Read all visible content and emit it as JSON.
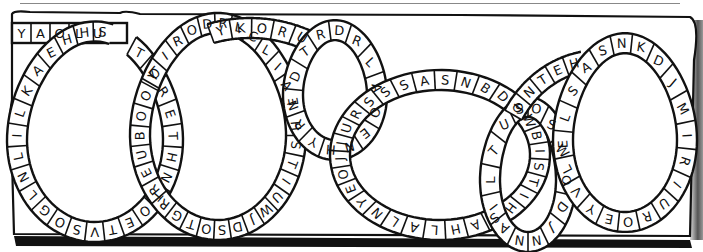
{
  "puzzle": {
    "type": "word-snake",
    "style": "hand-drawn black-and-white",
    "colors": {
      "ink": "#111111",
      "paper": "#ffffff"
    },
    "top_row": [
      "Y",
      "A",
      "O",
      "L",
      "U"
    ],
    "loops": [
      {
        "id": "loop-1",
        "letters": [
          "T",
          "L",
          "R",
          "E",
          "T",
          "H",
          "N",
          "T",
          "O",
          "E",
          "T",
          "V",
          "S",
          "O",
          "G",
          "L",
          "N",
          "L",
          "I",
          "L",
          "K",
          "A",
          "E",
          "H",
          "H",
          "S"
        ]
      },
      {
        "id": "loop-2",
        "letters": [
          "O",
          "I",
          "R",
          "O",
          "D",
          "R",
          "L",
          "C",
          "L",
          "I",
          "A",
          "N",
          "H",
          "S",
          "T",
          "I",
          "U",
          "W",
          "J",
          "D",
          "S",
          "O",
          "T",
          "G",
          "R",
          "R",
          "E",
          "U",
          "B",
          "O",
          "O",
          "Y"
        ]
      },
      {
        "id": "loop-3-top-arc",
        "letters": [
          "Y",
          "K",
          "O",
          "R",
          "U"
        ]
      },
      {
        "id": "loop-4",
        "letters": [
          "E",
          "D",
          "T",
          "R",
          "D",
          "R",
          "L",
          "A",
          "O",
          "E",
          "N",
          "H",
          "Y",
          "R"
        ]
      },
      {
        "id": "loop-5-top-arc",
        "letters": [
          "A",
          "S",
          "N",
          "B",
          "D",
          "O",
          "W",
          "B",
          "I",
          "S",
          "T",
          "I",
          "H",
          "S",
          "A",
          "H",
          "L",
          "A",
          "L",
          "N",
          "Y",
          "E",
          "O",
          "J",
          "J",
          "U",
          "R",
          "S",
          "S",
          "S"
        ]
      },
      {
        "id": "loop-6",
        "letters": [
          "O",
          "S",
          "W",
          "O",
          "D",
          "J",
          "N",
          "N",
          "A",
          "I",
          "L",
          "T",
          "U",
          "S"
        ]
      },
      {
        "id": "loop-7-top-arc",
        "letters": [
          "I",
          "N",
          "T",
          "E",
          "H"
        ]
      },
      {
        "id": "loop-8",
        "letters": [
          "S",
          "N",
          "K",
          "D",
          "J",
          "M",
          "I",
          "R",
          "I",
          "U",
          "R",
          "O",
          "E",
          "Y",
          "V",
          "L",
          "E",
          "L",
          "S",
          "A"
        ]
      }
    ]
  }
}
